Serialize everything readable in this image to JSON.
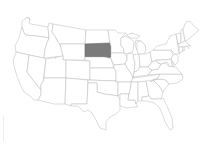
{
  "map": {
    "title": "United States",
    "region": "Contiguous United States",
    "highlighted_state": "South Dakota",
    "colors": {
      "background": "#ffffff",
      "state_fill": "#ffffff",
      "state_border": "#b8b8b8",
      "highlight_fill": "#7b7b7b"
    },
    "states": [
      {
        "id": "WA",
        "name": "Washington",
        "highlighted": false
      },
      {
        "id": "OR",
        "name": "Oregon",
        "highlighted": false
      },
      {
        "id": "CA",
        "name": "California",
        "highlighted": false
      },
      {
        "id": "ID",
        "name": "Idaho",
        "highlighted": false
      },
      {
        "id": "NV",
        "name": "Nevada",
        "highlighted": false
      },
      {
        "id": "MT",
        "name": "Montana",
        "highlighted": false
      },
      {
        "id": "WY",
        "name": "Wyoming",
        "highlighted": false
      },
      {
        "id": "UT",
        "name": "Utah",
        "highlighted": false
      },
      {
        "id": "AZ",
        "name": "Arizona",
        "highlighted": false
      },
      {
        "id": "CO",
        "name": "Colorado",
        "highlighted": false
      },
      {
        "id": "NM",
        "name": "New Mexico",
        "highlighted": false
      },
      {
        "id": "ND",
        "name": "North Dakota",
        "highlighted": false
      },
      {
        "id": "SD",
        "name": "South Dakota",
        "highlighted": true
      },
      {
        "id": "NE",
        "name": "Nebraska",
        "highlighted": false
      },
      {
        "id": "KS",
        "name": "Kansas",
        "highlighted": false
      },
      {
        "id": "OK",
        "name": "Oklahoma",
        "highlighted": false
      },
      {
        "id": "TX",
        "name": "Texas",
        "highlighted": false
      },
      {
        "id": "MN",
        "name": "Minnesota",
        "highlighted": false
      },
      {
        "id": "IA",
        "name": "Iowa",
        "highlighted": false
      },
      {
        "id": "MO",
        "name": "Missouri",
        "highlighted": false
      },
      {
        "id": "AR",
        "name": "Arkansas",
        "highlighted": false
      },
      {
        "id": "LA",
        "name": "Louisiana",
        "highlighted": false
      },
      {
        "id": "WI",
        "name": "Wisconsin",
        "highlighted": false
      },
      {
        "id": "IL",
        "name": "Illinois",
        "highlighted": false
      },
      {
        "id": "MI",
        "name": "Michigan",
        "highlighted": false
      },
      {
        "id": "IN",
        "name": "Indiana",
        "highlighted": false
      },
      {
        "id": "OH",
        "name": "Ohio",
        "highlighted": false
      },
      {
        "id": "KY",
        "name": "Kentucky",
        "highlighted": false
      },
      {
        "id": "TN",
        "name": "Tennessee",
        "highlighted": false
      },
      {
        "id": "MS",
        "name": "Mississippi",
        "highlighted": false
      },
      {
        "id": "AL",
        "name": "Alabama",
        "highlighted": false
      },
      {
        "id": "GA",
        "name": "Georgia",
        "highlighted": false
      },
      {
        "id": "FL",
        "name": "Florida",
        "highlighted": false
      },
      {
        "id": "SC",
        "name": "South Carolina",
        "highlighted": false
      },
      {
        "id": "NC",
        "name": "North Carolina",
        "highlighted": false
      },
      {
        "id": "VA",
        "name": "Virginia",
        "highlighted": false
      },
      {
        "id": "WV",
        "name": "West Virginia",
        "highlighted": false
      },
      {
        "id": "PA",
        "name": "Pennsylvania",
        "highlighted": false
      },
      {
        "id": "NY",
        "name": "New York",
        "highlighted": false
      },
      {
        "id": "VT",
        "name": "Vermont",
        "highlighted": false
      },
      {
        "id": "NH",
        "name": "New Hampshire",
        "highlighted": false
      },
      {
        "id": "ME",
        "name": "Maine",
        "highlighted": false
      },
      {
        "id": "MA",
        "name": "Massachusetts",
        "highlighted": false
      },
      {
        "id": "CT",
        "name": "Connecticut",
        "highlighted": false
      },
      {
        "id": "RI",
        "name": "Rhode Island",
        "highlighted": false
      },
      {
        "id": "NJ",
        "name": "New Jersey",
        "highlighted": false
      },
      {
        "id": "DE",
        "name": "Delaware",
        "highlighted": false
      },
      {
        "id": "MD",
        "name": "Maryland",
        "highlighted": false
      }
    ]
  }
}
